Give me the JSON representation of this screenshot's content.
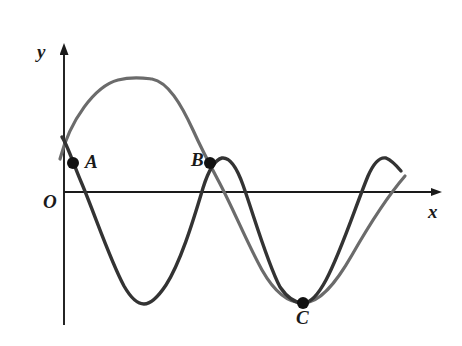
{
  "figure": {
    "background_color": "#ffffff",
    "width": 462,
    "height": 346
  },
  "axes": {
    "x_axis_label": "x",
    "y_axis_label": "y",
    "origin_label": "O",
    "axis_color": "#1a1a1a",
    "x_axis_y_px": 192,
    "y_axis_x_px": 64,
    "x_axis_start_px": 64,
    "x_axis_end_px": 443,
    "y_axis_top_px": 44,
    "y_axis_bottom_px": 325,
    "arrowheads": true,
    "ticks": [],
    "tick_labels": [],
    "grid": false
  },
  "points": [
    {
      "id": "A",
      "label": "A",
      "x_px": 73,
      "y_px": 163,
      "radius_px": 6,
      "color": "#111111"
    },
    {
      "id": "B",
      "label": "B",
      "x_px": 210,
      "y_px": 163,
      "radius_px": 6,
      "color": "#111111"
    },
    {
      "id": "C",
      "label": "C",
      "x_px": 303,
      "y_px": 303,
      "radius_px": 6,
      "color": "#111111"
    }
  ],
  "curves": [
    {
      "id": "gray-curve",
      "name": "long-period sinusoid",
      "color": "#6b6b6b",
      "stroke_width": 3.2,
      "path": "M 60 159 C 70 120, 95 86, 118 80 C 133 76, 144 78, 152 79 C 168 82, 181 104, 193 130 C 202 150, 210 165, 218 180 C 233 208, 247 243, 262 270 C 275 293, 289 303, 303 303 C 320 303, 336 283, 352 255 C 368 227, 386 198, 405 176"
    },
    {
      "id": "dark-curve",
      "name": "short-period sinusoid",
      "color": "#333333",
      "stroke_width": 3.4,
      "path": "M 62 137 C 68 146, 74 166, 82 184 C 95 215, 110 260, 124 286 C 132 300, 138 304, 144 304 C 151 304, 158 297, 166 285 C 180 263, 192 225, 203 188 C 208 172, 214 160, 222 158 C 230 157, 237 168, 243 185 C 254 216, 267 262, 280 287 C 289 300, 296 303, 303 303 C 311 303, 318 295, 326 280 C 341 252, 356 205, 368 176 C 375 160, 381 157, 386 158 C 391 160, 396 165, 401 171"
    }
  ],
  "chart_data": {
    "type": "line",
    "title": "",
    "xlabel": "x",
    "ylabel": "y",
    "grid": false,
    "legend": "none",
    "xlim": [
      0,
      1
    ],
    "ylim": [
      -1.1,
      1.1
    ],
    "annotations": [
      {
        "text": "A",
        "note": "intersection of both curves on the rising/falling crossing near the y-axis"
      },
      {
        "text": "B",
        "note": "second intersection of both curves above the x-axis"
      },
      {
        "text": "C",
        "note": "common minimum point of both curves below the x-axis"
      },
      {
        "text": "O",
        "note": "origin"
      }
    ],
    "series": [
      {
        "name": "gray-curve",
        "color": "#6b6b6b",
        "description": "slower sinusoid: rises from just below A to a maximum, descends through B down to the minimum at C, then rises again",
        "x": [
          0.0,
          0.05,
          0.1,
          0.15,
          0.2,
          0.25,
          0.3,
          0.35,
          0.4,
          0.45,
          0.5,
          0.55,
          0.6,
          0.65,
          0.7,
          0.75,
          0.8,
          0.85,
          0.9,
          0.95,
          1.0
        ],
        "y": [
          0.24,
          0.58,
          0.84,
          0.98,
          1.0,
          0.9,
          0.68,
          0.39,
          0.05,
          -0.3,
          -0.62,
          -0.86,
          -0.99,
          -1.0,
          -0.88,
          -0.65,
          -0.33,
          0.02,
          0.36,
          0.65,
          0.86
        ]
      },
      {
        "name": "dark-curve",
        "color": "#333333",
        "description": "faster sinusoid: starts high, dips to a trough, rises to a peak at B, falls to the trough at C, then rises to a final peak",
        "x": [
          0.0,
          0.05,
          0.1,
          0.15,
          0.2,
          0.25,
          0.3,
          0.35,
          0.4,
          0.45,
          0.5,
          0.55,
          0.6,
          0.65,
          0.7,
          0.75,
          0.8,
          0.85,
          0.9,
          0.95,
          1.0
        ],
        "y": [
          0.42,
          0.02,
          -0.44,
          -0.8,
          -0.99,
          -0.95,
          -0.68,
          -0.26,
          0.22,
          0.65,
          0.93,
          1.0,
          0.82,
          0.44,
          -0.05,
          -0.53,
          -0.86,
          -1.0,
          -0.88,
          -0.52,
          -0.02
        ]
      }
    ]
  }
}
